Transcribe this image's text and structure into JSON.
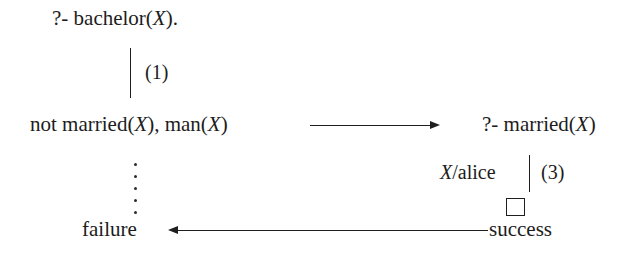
{
  "diagram": {
    "background_color": "#ffffff",
    "ink_color": "#1f1f1f",
    "nodes": {
      "root_goal": "?- bachelor(X).",
      "resolvent_goal": "not married(X), man(X)",
      "side_goal": "?- married(X)",
      "failure": "failure",
      "success": "success",
      "empty_clause_symbol": "□"
    },
    "edge_labels": {
      "clause_one": "(1)",
      "clause_three": "(3)"
    },
    "substitutions": {
      "alice_binding": "X/alice"
    },
    "variables": {
      "x": "X"
    },
    "text_fragments": {
      "root_prefix": "?- bachelor(",
      "root_suffix": ").",
      "resolvent_prefix": "not married(",
      "resolvent_middle": "), man(",
      "resolvent_suffix": ")",
      "side_prefix": "?- married(",
      "side_suffix": ")",
      "subst_suffix": "/alice"
    }
  }
}
